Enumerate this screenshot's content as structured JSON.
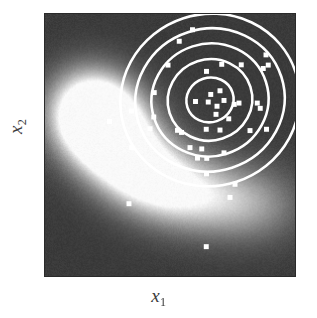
{
  "figure": {
    "type": "scatter-density-contour-plot",
    "background_color": "#ffffff",
    "plot_border_color": "#2a2a2a"
  },
  "axes": {
    "x_label_base": "x",
    "x_label_sub": "1",
    "y_label_base": "x",
    "y_label_sub": "2"
  },
  "chart_data": {
    "type": "scatter",
    "title": "",
    "xlabel": "x1",
    "ylabel": "x2",
    "xlim": [
      0,
      1
    ],
    "ylim": [
      0,
      1
    ],
    "grid": false,
    "legend": "none",
    "colors": {
      "point_color": "#ffffff",
      "contour_color": "#ffffff",
      "density_low": "#343434",
      "density_high": "#fbfbfb"
    },
    "density_field": {
      "kind": "crescent-ridge",
      "description": "Bright banana-shaped high-density ridge; peak near left-of-center, arcing down and right; dark in corners",
      "ridge_points": [
        {
          "x": 0.255,
          "y": 0.605,
          "intensity": 1.0
        },
        {
          "x": 0.205,
          "y": 0.555,
          "intensity": 0.95
        },
        {
          "x": 0.3,
          "y": 0.47,
          "intensity": 0.92
        },
        {
          "x": 0.37,
          "y": 0.41,
          "intensity": 0.84
        },
        {
          "x": 0.455,
          "y": 0.355,
          "intensity": 0.76
        },
        {
          "x": 0.56,
          "y": 0.32,
          "intensity": 0.66
        },
        {
          "x": 0.68,
          "y": 0.295,
          "intensity": 0.56
        },
        {
          "x": 0.8,
          "y": 0.28,
          "intensity": 0.46
        },
        {
          "x": 0.92,
          "y": 0.27,
          "intensity": 0.34
        },
        {
          "x": 0.17,
          "y": 0.68,
          "intensity": 0.7
        },
        {
          "x": 0.15,
          "y": 0.62,
          "intensity": 0.62
        }
      ]
    },
    "contours": {
      "count": 5,
      "center": {
        "x": 0.66,
        "y": 0.672
      },
      "rotation_deg": -18,
      "levels": [
        1,
        2,
        3,
        4,
        5
      ],
      "rx": [
        0.095,
        0.17,
        0.235,
        0.3,
        0.36
      ],
      "ry": [
        0.085,
        0.155,
        0.215,
        0.272,
        0.328
      ],
      "line_width_px": 2.6
    },
    "points": [
      {
        "x": 0.537,
        "y": 0.896
      },
      {
        "x": 0.884,
        "y": 0.844
      },
      {
        "x": 0.435,
        "y": 0.607
      },
      {
        "x": 0.437,
        "y": 0.7
      },
      {
        "x": 0.602,
        "y": 0.666
      },
      {
        "x": 0.653,
        "y": 0.664
      },
      {
        "x": 0.663,
        "y": 0.693
      },
      {
        "x": 0.716,
        "y": 0.67
      },
      {
        "x": 0.688,
        "y": 0.648
      },
      {
        "x": 0.7,
        "y": 0.707
      },
      {
        "x": 0.684,
        "y": 0.617
      },
      {
        "x": 0.757,
        "y": 0.655
      },
      {
        "x": 0.776,
        "y": 0.66
      },
      {
        "x": 0.849,
        "y": 0.66
      },
      {
        "x": 0.861,
        "y": 0.64
      },
      {
        "x": 0.646,
        "y": 0.781
      },
      {
        "x": 0.707,
        "y": 0.808
      },
      {
        "x": 0.785,
        "y": 0.806
      },
      {
        "x": 0.873,
        "y": 0.792
      },
      {
        "x": 0.893,
        "y": 0.805
      },
      {
        "x": 0.492,
        "y": 0.805
      },
      {
        "x": 0.42,
        "y": 0.562
      },
      {
        "x": 0.346,
        "y": 0.63
      },
      {
        "x": 0.258,
        "y": 0.59
      },
      {
        "x": 0.347,
        "y": 0.49
      },
      {
        "x": 0.53,
        "y": 0.556
      },
      {
        "x": 0.546,
        "y": 0.548
      },
      {
        "x": 0.645,
        "y": 0.56
      },
      {
        "x": 0.7,
        "y": 0.557
      },
      {
        "x": 0.735,
        "y": 0.6
      },
      {
        "x": 0.58,
        "y": 0.49
      },
      {
        "x": 0.627,
        "y": 0.485
      },
      {
        "x": 0.61,
        "y": 0.45
      },
      {
        "x": 0.647,
        "y": 0.449
      },
      {
        "x": 0.716,
        "y": 0.47
      },
      {
        "x": 0.646,
        "y": 0.39
      },
      {
        "x": 0.76,
        "y": 0.35
      },
      {
        "x": 0.82,
        "y": 0.555
      },
      {
        "x": 0.886,
        "y": 0.56
      },
      {
        "x": 0.336,
        "y": 0.276
      },
      {
        "x": 0.74,
        "y": 0.3
      },
      {
        "x": 0.645,
        "y": 0.112
      },
      {
        "x": 0.59,
        "y": 0.94
      }
    ],
    "point_size_px": 5
  }
}
